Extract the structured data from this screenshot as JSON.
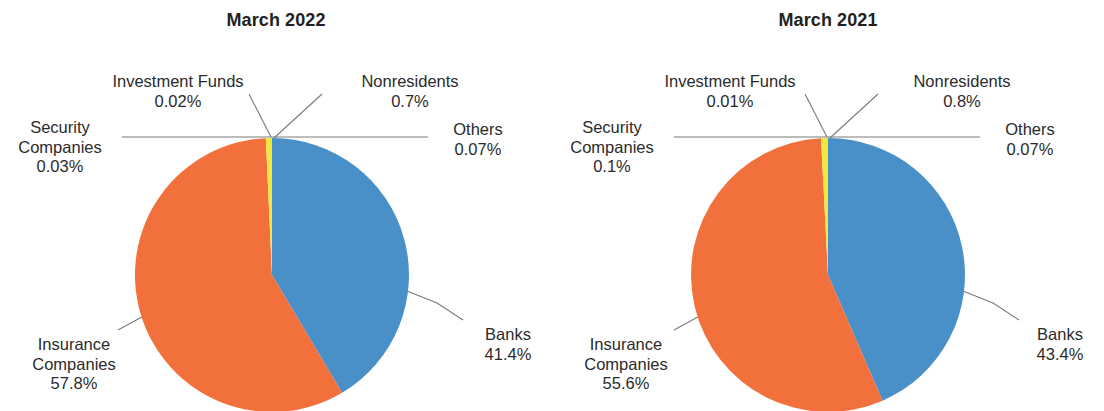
{
  "figure": {
    "background": "#ffffff",
    "width": 1104,
    "height": 411
  },
  "palette": {
    "banks": "#4a90c8",
    "insurance_companies": "#f2703c",
    "nonresidents": "#f2e93c",
    "security_companies": "#f2703c",
    "investment_funds": "#f2e93c",
    "others": "#4a90c8",
    "text": "#2b2b2b",
    "leader_line": "#7a7a7a"
  },
  "panels": [
    {
      "key": "march_2022",
      "title": "March 2022",
      "labels": {
        "security_companies_name": "Security",
        "security_companies_name2": "Companies",
        "security_companies_value": "0.03%",
        "investment_funds_name": "Investment Funds",
        "investment_funds_value": "0.02%",
        "nonresidents_name": "Nonresidents",
        "nonresidents_value": "0.7%",
        "others_name": "Others",
        "others_value": "0.07%",
        "banks_name": "Banks",
        "banks_value": "41.4%",
        "insurance_companies_name": "Insurance",
        "insurance_companies_name2": "Companies",
        "insurance_companies_value": "57.8%"
      }
    },
    {
      "key": "march_2021",
      "title": "March 2021",
      "labels": {
        "security_companies_name": "Security",
        "security_companies_name2": "Companies",
        "security_companies_value": "0.1%",
        "investment_funds_name": "Investment Funds",
        "investment_funds_value": "0.01%",
        "nonresidents_name": "Nonresidents",
        "nonresidents_value": "0.8%",
        "others_name": "Others",
        "others_value": "0.07%",
        "banks_name": "Banks",
        "banks_value": "43.4%",
        "insurance_companies_name": "Insurance",
        "insurance_companies_name2": "Companies",
        "insurance_companies_value": "55.6%"
      }
    }
  ],
  "chart_data": [
    {
      "type": "pie",
      "title": "March 2022",
      "labels": [
        "Banks",
        "Others",
        "Insurance Companies",
        "Security Companies",
        "Investment Funds",
        "Nonresidents"
      ],
      "values": [
        41.4,
        0.07,
        57.8,
        0.03,
        0.02,
        0.7
      ],
      "value_labels": [
        "41.4%",
        "0.07%",
        "57.8%",
        "0.03%",
        "0.02%",
        "0.7%"
      ],
      "colors": [
        "#4a90c8",
        "#4a90c8",
        "#f2703c",
        "#f2703c",
        "#f2e93c",
        "#f2e93c"
      ],
      "units": "percent",
      "start_angle_deg": 0,
      "direction": "clockwise",
      "legend": "none",
      "grid": false,
      "labels_placement": "outside-with-leader-lines"
    },
    {
      "type": "pie",
      "title": "March 2021",
      "labels": [
        "Banks",
        "Others",
        "Insurance Companies",
        "Security Companies",
        "Investment Funds",
        "Nonresidents"
      ],
      "values": [
        43.4,
        0.07,
        55.6,
        0.1,
        0.01,
        0.8
      ],
      "value_labels": [
        "43.4%",
        "0.07%",
        "55.6%",
        "0.1%",
        "0.01%",
        "0.8%"
      ],
      "colors": [
        "#4a90c8",
        "#4a90c8",
        "#f2703c",
        "#f2703c",
        "#f2e93c",
        "#f2e93c"
      ],
      "units": "percent",
      "start_angle_deg": 0,
      "direction": "clockwise",
      "legend": "none",
      "grid": false,
      "labels_placement": "outside-with-leader-lines"
    }
  ]
}
